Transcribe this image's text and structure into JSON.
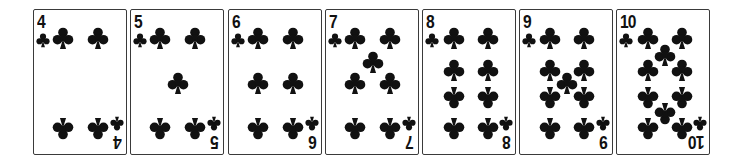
{
  "colors": {
    "ink": "#111111",
    "border": "#3a3a3a",
    "background": "#ffffff"
  },
  "suit": "clubs",
  "suit_icon": "club-icon",
  "cards": [
    {
      "rank": "4",
      "left": 33,
      "pips": [
        [
          29,
          28,
          0
        ],
        [
          64,
          28,
          0
        ],
        [
          29,
          118,
          1
        ],
        [
          64,
          118,
          1
        ]
      ]
    },
    {
      "rank": "5",
      "left": 130,
      "pips": [
        [
          29,
          28,
          0
        ],
        [
          64,
          28,
          0
        ],
        [
          47,
          73,
          0
        ],
        [
          29,
          118,
          1
        ],
        [
          64,
          118,
          1
        ]
      ]
    },
    {
      "rank": "6",
      "left": 228,
      "pips": [
        [
          29,
          28,
          0
        ],
        [
          64,
          28,
          0
        ],
        [
          29,
          73,
          0
        ],
        [
          64,
          73,
          0
        ],
        [
          29,
          118,
          1
        ],
        [
          64,
          118,
          1
        ]
      ]
    },
    {
      "rank": "7",
      "left": 325,
      "pips": [
        [
          29,
          28,
          0
        ],
        [
          64,
          28,
          0
        ],
        [
          47,
          52,
          0
        ],
        [
          29,
          73,
          0
        ],
        [
          64,
          73,
          0
        ],
        [
          29,
          118,
          1
        ],
        [
          64,
          118,
          1
        ]
      ]
    },
    {
      "rank": "8",
      "left": 422,
      "pips": [
        [
          31,
          28,
          0
        ],
        [
          65,
          28,
          0
        ],
        [
          31,
          60,
          0
        ],
        [
          65,
          60,
          0
        ],
        [
          31,
          87,
          1
        ],
        [
          65,
          87,
          1
        ],
        [
          31,
          118,
          1
        ],
        [
          65,
          118,
          1
        ]
      ]
    },
    {
      "rank": "9",
      "left": 519,
      "pips": [
        [
          30,
          28,
          0
        ],
        [
          64,
          28,
          0
        ],
        [
          30,
          60,
          0
        ],
        [
          64,
          60,
          0
        ],
        [
          47,
          73,
          0
        ],
        [
          30,
          87,
          1
        ],
        [
          64,
          87,
          1
        ],
        [
          30,
          118,
          1
        ],
        [
          64,
          118,
          1
        ]
      ]
    },
    {
      "rank": "10",
      "left": 616,
      "pips": [
        [
          31,
          28,
          0
        ],
        [
          65,
          28,
          0
        ],
        [
          48,
          45,
          0
        ],
        [
          31,
          60,
          0
        ],
        [
          65,
          60,
          0
        ],
        [
          31,
          87,
          1
        ],
        [
          65,
          87,
          1
        ],
        [
          48,
          103,
          1
        ],
        [
          31,
          118,
          1
        ],
        [
          65,
          118,
          1
        ]
      ]
    }
  ]
}
